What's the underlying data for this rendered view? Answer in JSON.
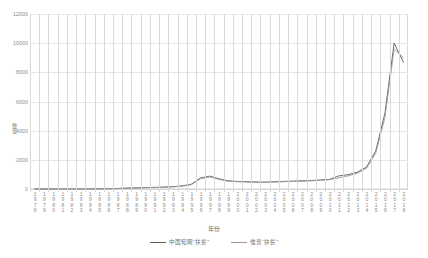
{
  "chart_data": {
    "type": "line",
    "title": "",
    "xlabel": "年份",
    "ylabel": "数量",
    "ylim": [
      0,
      12000
    ],
    "yticks": [
      0,
      2000,
      4000,
      6000,
      8000,
      10000,
      12000
    ],
    "ytick_labels": [
      "0",
      "2000",
      "4000",
      "6000",
      "8000",
      "10000",
      "12000"
    ],
    "grid": true,
    "legend_position": "bottom",
    "categories": [
      "1978",
      "1979",
      "1980",
      "1981",
      "1982",
      "1983",
      "1984",
      "1985",
      "1986",
      "1987",
      "1988",
      "1989",
      "1990",
      "1991",
      "1992",
      "1993",
      "1994",
      "1995",
      "1996",
      "1997",
      "1998",
      "1999",
      "2000",
      "2001",
      "2002",
      "2003",
      "2004",
      "2005",
      "2006",
      "2007",
      "2008",
      "2009",
      "2010",
      "2011",
      "2012",
      "2013",
      "2014",
      "2015",
      "2016",
      "2017",
      "2018"
    ],
    "series": [
      {
        "name": "中国知网“扶贫”",
        "color": "#595959",
        "values": [
          2,
          2,
          3,
          3,
          4,
          5,
          8,
          12,
          20,
          35,
          60,
          80,
          95,
          110,
          130,
          160,
          210,
          330,
          760,
          880,
          700,
          560,
          520,
          500,
          480,
          470,
          500,
          520,
          540,
          560,
          580,
          620,
          660,
          900,
          980,
          1150,
          1500,
          2600,
          5200,
          10000,
          8700
        ]
      },
      {
        "name": "维普“扶贫”",
        "color": "#9a9a9a",
        "values": [
          2,
          2,
          3,
          3,
          4,
          5,
          7,
          10,
          18,
          30,
          52,
          72,
          88,
          100,
          120,
          150,
          195,
          300,
          700,
          830,
          660,
          530,
          500,
          480,
          460,
          455,
          480,
          500,
          520,
          540,
          560,
          600,
          640,
          760,
          900,
          1080,
          1420,
          2450,
          4900,
          9600,
          9000
        ]
      }
    ]
  },
  "legend": {
    "items": [
      {
        "label": "中国知网“扶贫”"
      },
      {
        "label": "维普“扶贫”"
      }
    ]
  },
  "axes": {
    "x_title": "年份",
    "y_title": "数量"
  }
}
